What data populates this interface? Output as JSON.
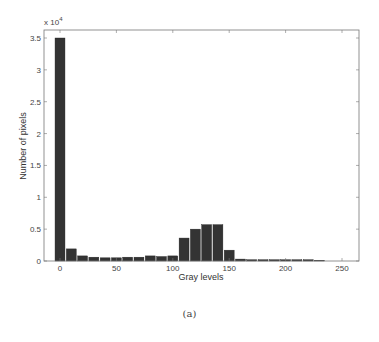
{
  "chart_data": {
    "type": "bar",
    "title": "",
    "xlabel": "Gray levels",
    "ylabel": "Number of pixels",
    "y_multiplier_label": "x 10^4",
    "categories": [
      0,
      10,
      20,
      30,
      40,
      50,
      60,
      70,
      80,
      90,
      100,
      110,
      120,
      130,
      140,
      150,
      160,
      170,
      180,
      190,
      200,
      210,
      220,
      230,
      240,
      250
    ],
    "values": [
      35000,
      1900,
      800,
      600,
      500,
      500,
      600,
      600,
      800,
      700,
      800,
      3600,
      5000,
      5700,
      5700,
      1700,
      300,
      200,
      200,
      200,
      200,
      200,
      200,
      100,
      0,
      0
    ],
    "xlim": [
      -10,
      265
    ],
    "ylim": [
      0,
      36000
    ],
    "xticks": [
      0,
      50,
      100,
      150,
      200,
      250
    ],
    "yticks": [
      0,
      0.5,
      1,
      1.5,
      2,
      2.5,
      3,
      3.5
    ],
    "ytick_labels": [
      "0",
      "0.5",
      "1",
      "1.5",
      "2",
      "2.5",
      "3",
      "3.5"
    ],
    "grid": false,
    "legend": null,
    "bar_color": "#333333"
  },
  "figure": {
    "caption": "(a)",
    "exponent_label_base": "x 10",
    "exponent_label_power": "4"
  }
}
